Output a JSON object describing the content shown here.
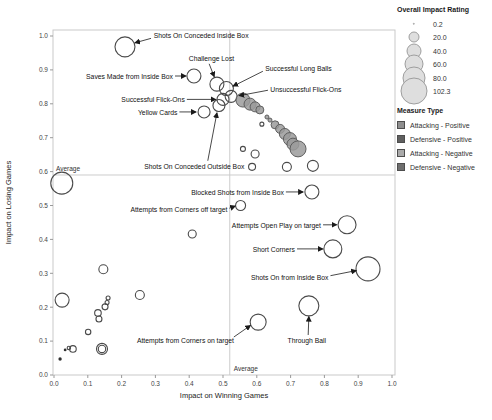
{
  "chart_data": {
    "type": "scatter",
    "title": "",
    "xlabel": "Impact on Winning Games",
    "ylabel": "Impact on Losing Games",
    "xlim": [
      0.0,
      1.0
    ],
    "ylim": [
      0.0,
      1.0
    ],
    "xticks": [
      0.0,
      0.1,
      0.2,
      0.3,
      0.4,
      0.5,
      0.6,
      0.7,
      0.8,
      0.9,
      1.0
    ],
    "yticks": [
      0.0,
      0.1,
      0.2,
      0.3,
      0.4,
      0.5,
      0.6,
      0.7,
      0.8,
      0.9,
      1.0
    ],
    "grid": false,
    "average_lines": {
      "label": "Average",
      "x": 0.52,
      "y": 0.59
    },
    "colors": {
      "open_stroke": "#4a4a4a",
      "filled_fill": "#9b9b9b",
      "filled_stroke": "#5e5e5e",
      "dot_fill": "#2f2f2f",
      "axis_line": "#c9c9c9",
      "tick_text": "#444444",
      "annotation_text": "#111111",
      "arrow": "#1a1a1a",
      "average_line": "#cccccc"
    },
    "points": [
      {
        "x": 0.21,
        "y": 0.968,
        "r": 10,
        "style": "open",
        "label": "Shots On Conceded Inside Box"
      },
      {
        "x": 0.414,
        "y": 0.882,
        "r": 7,
        "style": "open",
        "label": "Saves Made from Inside Box"
      },
      {
        "x": 0.482,
        "y": 0.858,
        "r": 7,
        "style": "open",
        "label": "Challenge Lost"
      },
      {
        "x": 0.51,
        "y": 0.845,
        "r": 7,
        "style": "open",
        "label": "Successful Long Balls"
      },
      {
        "x": 0.524,
        "y": 0.822,
        "r": 6,
        "style": "open",
        "label": "Unsuccessful Flick-Ons"
      },
      {
        "x": 0.5,
        "y": 0.813,
        "r": 6,
        "style": "open",
        "label": "Successful Flick-Ons"
      },
      {
        "x": 0.488,
        "y": 0.795,
        "r": 6,
        "style": "open",
        "label": "Shots On Conceded Outside Box"
      },
      {
        "x": 0.444,
        "y": 0.776,
        "r": 6,
        "style": "open",
        "label": "Yellow Cards"
      },
      {
        "x": 0.763,
        "y": 0.54,
        "r": 7,
        "style": "open",
        "label": "Blocked Shots from Inside Box"
      },
      {
        "x": 0.552,
        "y": 0.5,
        "r": 5,
        "style": "open",
        "label": "Attempts from Corners off target"
      },
      {
        "x": 0.867,
        "y": 0.443,
        "r": 9,
        "style": "open",
        "label": "Attempts Open Play on target"
      },
      {
        "x": 0.825,
        "y": 0.372,
        "r": 9,
        "style": "open",
        "label": "Short Corners"
      },
      {
        "x": 0.929,
        "y": 0.313,
        "r": 12,
        "style": "open",
        "label": "Shots On from Inside Box"
      },
      {
        "x": 0.754,
        "y": 0.204,
        "r": 10,
        "style": "open",
        "label": "Through Ball"
      },
      {
        "x": 0.604,
        "y": 0.156,
        "r": 8,
        "style": "open",
        "label": "Attempts from Corners on target"
      },
      {
        "x": 0.559,
        "y": 0.811,
        "r": 7,
        "style": "filled"
      },
      {
        "x": 0.58,
        "y": 0.799,
        "r": 6,
        "style": "filled"
      },
      {
        "x": 0.595,
        "y": 0.791,
        "r": 5,
        "style": "filled"
      },
      {
        "x": 0.609,
        "y": 0.782,
        "r": 4,
        "style": "filled"
      },
      {
        "x": 0.63,
        "y": 0.761,
        "r": 2,
        "style": "filled"
      },
      {
        "x": 0.639,
        "y": 0.752,
        "r": 2,
        "style": "filled"
      },
      {
        "x": 0.654,
        "y": 0.738,
        "r": 4,
        "style": "filled"
      },
      {
        "x": 0.669,
        "y": 0.726,
        "r": 4.5,
        "style": "filled"
      },
      {
        "x": 0.683,
        "y": 0.711,
        "r": 5.5,
        "style": "filled"
      },
      {
        "x": 0.698,
        "y": 0.696,
        "r": 6.5,
        "style": "filled"
      },
      {
        "x": 0.707,
        "y": 0.681,
        "r": 6,
        "style": "filled"
      },
      {
        "x": 0.722,
        "y": 0.667,
        "r": 8,
        "style": "filled"
      },
      {
        "x": 0.615,
        "y": 0.74,
        "r": 2,
        "style": "open"
      },
      {
        "x": 0.559,
        "y": 0.667,
        "r": 2.5,
        "style": "open"
      },
      {
        "x": 0.595,
        "y": 0.652,
        "r": 4,
        "style": "open"
      },
      {
        "x": 0.586,
        "y": 0.614,
        "r": 3.5,
        "style": "open"
      },
      {
        "x": 0.689,
        "y": 0.614,
        "r": 4.5,
        "style": "open"
      },
      {
        "x": 0.766,
        "y": 0.617,
        "r": 5.5,
        "style": "open"
      },
      {
        "x": 0.023,
        "y": 0.566,
        "r": 11,
        "style": "open"
      },
      {
        "x": 0.024,
        "y": 0.221,
        "r": 7,
        "style": "open"
      },
      {
        "x": 0.146,
        "y": 0.312,
        "r": 4.5,
        "style": "open"
      },
      {
        "x": 0.254,
        "y": 0.236,
        "r": 4.5,
        "style": "open"
      },
      {
        "x": 0.409,
        "y": 0.416,
        "r": 4,
        "style": "open"
      },
      {
        "x": 0.16,
        "y": 0.227,
        "r": 2,
        "style": "open"
      },
      {
        "x": 0.157,
        "y": 0.214,
        "r": 2,
        "style": "open"
      },
      {
        "x": 0.151,
        "y": 0.201,
        "r": 3,
        "style": "open"
      },
      {
        "x": 0.13,
        "y": 0.183,
        "r": 3.3,
        "style": "open"
      },
      {
        "x": 0.133,
        "y": 0.165,
        "r": 3,
        "style": "open"
      },
      {
        "x": 0.101,
        "y": 0.127,
        "r": 2.7,
        "style": "open"
      },
      {
        "x": 0.056,
        "y": 0.077,
        "r": 3.3,
        "style": "open"
      },
      {
        "x": 0.044,
        "y": 0.08,
        "r": 1.7,
        "style": "open"
      },
      {
        "x": 0.142,
        "y": 0.077,
        "r": 5.5,
        "style": "open"
      },
      {
        "x": 0.142,
        "y": 0.077,
        "r": 3.7,
        "style": "open"
      },
      {
        "x": 0.033,
        "y": 0.074,
        "r": 1.4,
        "style": "dot"
      },
      {
        "x": 0.018,
        "y": 0.047,
        "r": 1.7,
        "style": "dot"
      }
    ],
    "annotations": [
      {
        "text": "Shots On Conceded Inside Box",
        "lx": 0.295,
        "ly": 1.0,
        "anchor": "start",
        "arrow": [
          0.287,
          0.993,
          0.24,
          0.98
        ]
      },
      {
        "text": "Challenge Lost",
        "lx": 0.466,
        "ly": 0.932,
        "anchor": "middle",
        "arrow": [
          0.459,
          0.918,
          0.474,
          0.88
        ]
      },
      {
        "text": "Saves Made from Inside Box",
        "lx": 0.352,
        "ly": 0.88,
        "anchor": "end",
        "arrow": [
          0.358,
          0.882,
          0.39,
          0.882
        ]
      },
      {
        "text": "Successful Long Balls",
        "lx": 0.625,
        "ly": 0.903,
        "anchor": "start",
        "arrow": [
          0.618,
          0.896,
          0.53,
          0.852
        ]
      },
      {
        "text": "Unsuccessful Flick-Ons",
        "lx": 0.64,
        "ly": 0.842,
        "anchor": "start",
        "arrow": [
          0.633,
          0.84,
          0.548,
          0.824
        ]
      },
      {
        "text": "Successful Flick-Ons",
        "lx": 0.387,
        "ly": 0.812,
        "anchor": "end",
        "arrow": [
          0.393,
          0.813,
          0.478,
          0.813
        ]
      },
      {
        "text": "Yellow Cards",
        "lx": 0.365,
        "ly": 0.774,
        "anchor": "end",
        "arrow": [
          0.371,
          0.776,
          0.42,
          0.776
        ]
      },
      {
        "text": "Shots On Conceded Outside Box",
        "lx": 0.415,
        "ly": 0.615,
        "anchor": "middle",
        "arrow": [
          0.455,
          0.632,
          0.482,
          0.773
        ]
      },
      {
        "text": "Blocked Shots from Inside Box",
        "lx": 0.68,
        "ly": 0.538,
        "anchor": "end",
        "arrow": [
          0.686,
          0.54,
          0.737,
          0.54
        ]
      },
      {
        "text": "Attempts from Corners off target",
        "lx": 0.513,
        "ly": 0.488,
        "anchor": "end",
        "arrow": [
          0.519,
          0.492,
          0.536,
          0.498
        ]
      },
      {
        "text": "Attempts Open Play on target",
        "lx": 0.79,
        "ly": 0.441,
        "anchor": "end",
        "arrow": [
          0.796,
          0.443,
          0.836,
          0.443
        ]
      },
      {
        "text": "Short Corners",
        "lx": 0.713,
        "ly": 0.37,
        "anchor": "end",
        "arrow": [
          0.719,
          0.372,
          0.795,
          0.372
        ]
      },
      {
        "text": "Shots On from Inside Box",
        "lx": 0.812,
        "ly": 0.288,
        "anchor": "end",
        "arrow": [
          0.818,
          0.293,
          0.894,
          0.308
        ]
      },
      {
        "text": "Through Ball",
        "lx": 0.748,
        "ly": 0.1,
        "anchor": "middle",
        "arrow": [
          0.752,
          0.118,
          0.754,
          0.172
        ]
      },
      {
        "text": "Attempts from Corners on target",
        "lx": 0.389,
        "ly": 0.1,
        "anchor": "middle",
        "arrow": [
          0.532,
          0.112,
          0.581,
          0.146
        ]
      }
    ],
    "size_legend": {
      "title": "Overall Impact Rating",
      "entries": [
        {
          "value": "0.2",
          "r": 1.2
        },
        {
          "value": "20.0",
          "r": 5.5
        },
        {
          "value": "40.0",
          "r": 7.5
        },
        {
          "value": "60.0",
          "r": 9.5
        },
        {
          "value": "80.0",
          "r": 11.5
        },
        {
          "value": "102.3",
          "r": 13.5
        }
      ],
      "bubble_fill": "#dedede",
      "bubble_stroke": "#9e9e9e"
    },
    "type_legend": {
      "title": "Measure Type",
      "items": [
        {
          "label": "Attacking - Positive",
          "color": "#8e8e8e"
        },
        {
          "label": "Defensive - Positive",
          "color": "#5f5f5f"
        },
        {
          "label": "Attacking - Negative",
          "color": "#aaaaaa"
        },
        {
          "label": "Defensive - Negative",
          "color": "#6e6e6e"
        }
      ]
    }
  }
}
